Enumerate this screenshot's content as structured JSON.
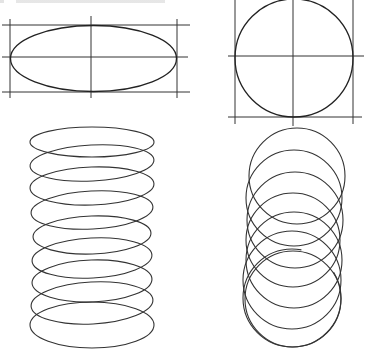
{
  "figure": {
    "caption_visible": "",
    "caption_note": "top caption text cropped and illegible",
    "stroke_color": "#222222",
    "background": "#ffffff"
  },
  "panels": [
    {
      "id": "ellipse-in-box",
      "box": {
        "x1": 10,
        "y1": 25,
        "x2": 177,
        "y2": 92
      },
      "center": {
        "x": 91,
        "y": 57
      },
      "ellipse": {
        "cx": 93,
        "cy": 58,
        "rx": 83,
        "ry": 33
      }
    },
    {
      "id": "circle-in-box",
      "box": {
        "x1": 235,
        "y1": 0,
        "x2": 353,
        "y2": 117
      },
      "center": {
        "x": 293,
        "y": 56
      },
      "circle": {
        "cx": 294,
        "cy": 58,
        "r": 59
      }
    },
    {
      "id": "elliptical-spring",
      "loops": 9,
      "top_y": 128,
      "bottom_y": 348,
      "x_left": 30,
      "x_right": 155,
      "loop_rx": 62,
      "loop_ry": 22
    },
    {
      "id": "circular-coil",
      "loops": 8,
      "top_y": 128,
      "bottom_y": 347,
      "circle_r": 48,
      "center_x": 294
    }
  ]
}
